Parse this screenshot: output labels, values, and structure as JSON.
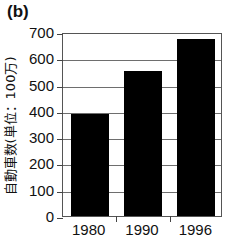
{
  "figure": {
    "panel_label": "(b)"
  },
  "chart_data": {
    "type": "bar",
    "title": "",
    "panel": "(b)",
    "categories": [
      "1980",
      "1990",
      "1996"
    ],
    "values": [
      390,
      550,
      675
    ],
    "xlabel": "",
    "ylabel": "自動車数(単位：100万)",
    "ylim": [
      0,
      700
    ],
    "ytick_labels": [
      "700",
      "600",
      "500",
      "400",
      "300",
      "200",
      "100",
      "0"
    ],
    "ytick_values": [
      700,
      600,
      500,
      400,
      300,
      200,
      100,
      0
    ],
    "grid": true,
    "legend": false,
    "bar_color": "#000000",
    "grid_color": "#6e6e6e",
    "axis_color": "#555555"
  }
}
